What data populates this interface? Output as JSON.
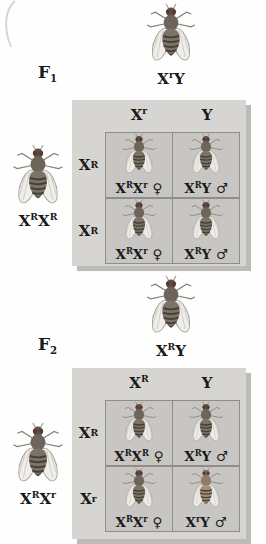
{
  "figure": {
    "type": "punnett-square-cross-diagram",
    "organism": "fruit fly"
  },
  "colors": {
    "panel_bg": "#d7d5d2",
    "cell_bg": "#c8c6c2",
    "grid_border": "#8f8d89",
    "shadow": "#bdbbb7",
    "text": "#1a1a1a",
    "fly_body": "#6b655b",
    "fly_head": "#57514a",
    "fly_abdomen": "#7a7366",
    "fly_stripe": "#453f36",
    "fly_eye": "#63342a",
    "fly_wing": "#efede9",
    "fly_wing_edge": "#a9a59c",
    "fly_leg": "#847d70",
    "fly_body_light": "#8d7c66",
    "fly_head_light": "#766654",
    "fly_abdomen_light": "#a3917a"
  },
  "sections": [
    {
      "generation_label": "F_1",
      "top_parent": {
        "genotype": "X^rY",
        "fly": "gray"
      },
      "left_parent": {
        "genotype": "X^RX^R",
        "fly": "gray"
      },
      "punnett": {
        "col_headers": [
          "X^r",
          "Y"
        ],
        "row_headers": [
          "X^R",
          "X^R"
        ],
        "cells": [
          {
            "genotype": "X^RX^r ♀",
            "fly": "gray"
          },
          {
            "genotype": "X^RY ♂",
            "fly": "gray"
          },
          {
            "genotype": "X^RX^r ♀",
            "fly": "gray"
          },
          {
            "genotype": "X^RY ♂",
            "fly": "gray"
          }
        ]
      }
    },
    {
      "generation_label": "F_2",
      "top_parent": {
        "genotype": "X^RY",
        "fly": "gray"
      },
      "left_parent": {
        "genotype": "X^RX^r",
        "fly": "gray"
      },
      "punnett": {
        "col_headers": [
          "X^R",
          "Y"
        ],
        "row_headers": [
          "X^R",
          "X^r"
        ],
        "cells": [
          {
            "genotype": "X^RX^R ♀",
            "fly": "gray"
          },
          {
            "genotype": "X^RY ♂",
            "fly": "gray"
          },
          {
            "genotype": "X^RX^r ♀",
            "fly": "gray"
          },
          {
            "genotype": "X^rY ♂",
            "fly": "light"
          }
        ]
      }
    }
  ]
}
